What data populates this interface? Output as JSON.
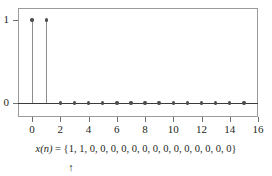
{
  "figure": {
    "caption_prefix": "x(n) = {",
    "caption_suffix": "}",
    "caption_separator": ", ",
    "arrow_glyph": "↑",
    "arrow_points_to_index": 0,
    "frame_color": "#9a9a9a",
    "baseline_color": "#3b3b3b",
    "stem_color": "#8d8d8d",
    "marker_color": "#4d4d4d",
    "text_color": "#231f20"
  },
  "chart_data": {
    "type": "line",
    "plot_style": "stem",
    "title": "",
    "subtitle": "",
    "xlabel": "",
    "ylabel": "",
    "x": [
      0,
      1,
      2,
      3,
      4,
      5,
      6,
      7,
      8,
      9,
      10,
      11,
      12,
      13,
      14,
      15
    ],
    "values": [
      1,
      1,
      0,
      0,
      0,
      0,
      0,
      0,
      0,
      0,
      0,
      0,
      0,
      0,
      0,
      0
    ],
    "series": [
      {
        "name": "x(n)",
        "values": [
          1,
          1,
          0,
          0,
          0,
          0,
          0,
          0,
          0,
          0,
          0,
          0,
          0,
          0,
          0,
          0
        ]
      }
    ],
    "xlim": [
      -1,
      16
    ],
    "ylim": [
      -0.12,
      1.18
    ],
    "xticks": [
      0,
      2,
      4,
      6,
      8,
      10,
      12,
      14,
      16
    ],
    "xticklabels": [
      "0",
      "2",
      "4",
      "6",
      "8",
      "10",
      "12",
      "14",
      "16"
    ],
    "yticks": [
      0,
      1
    ],
    "yticklabels": [
      "0",
      "1"
    ],
    "grid": false,
    "legend": false,
    "legend_position": "none",
    "annotations": [
      {
        "text": "x(n) = {1, 1, 0, 0, 0, 0, 0, 0, 0, 0, 0, 0, 0, 0, 0, 0}",
        "position": "below-axis"
      },
      {
        "text": "↑",
        "position": "under-first-element"
      }
    ]
  }
}
